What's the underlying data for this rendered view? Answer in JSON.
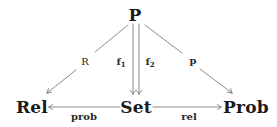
{
  "diagram": {
    "type": "commutative-diagram",
    "nodes": {
      "P": {
        "label": "P",
        "x": 135,
        "y": 15
      },
      "Rel": {
        "label": "Rel",
        "x": 32,
        "y": 107
      },
      "Set": {
        "label": "Set",
        "x": 136,
        "y": 107
      },
      "Prob": {
        "label": "Prob",
        "x": 246,
        "y": 107
      }
    },
    "edges": [
      {
        "id": "R",
        "from": "P",
        "to": "Rel",
        "label": "R",
        "label_x": 85,
        "label_y": 62
      },
      {
        "id": "f1",
        "from": "P",
        "to": "Set",
        "label_main": "f",
        "label_sub": "1",
        "label_x": 120,
        "label_y": 62
      },
      {
        "id": "f2",
        "from": "P",
        "to": "Set",
        "label_main": "f",
        "label_sub": "2",
        "label_x": 150,
        "label_y": 62
      },
      {
        "id": "p",
        "from": "P",
        "to": "Prob",
        "label": "p",
        "label_x": 193,
        "label_y": 62
      },
      {
        "id": "prob",
        "from": "Set",
        "to": "Rel",
        "label": "prob",
        "label_x": 84,
        "label_y": 117
      },
      {
        "id": "rel",
        "from": "Set",
        "to": "Prob",
        "label": "rel",
        "label_x": 189,
        "label_y": 117
      }
    ],
    "colors": {
      "text": "#1a1a1a",
      "arrow": "#6e6e6e",
      "background": "#ffffff"
    }
  }
}
